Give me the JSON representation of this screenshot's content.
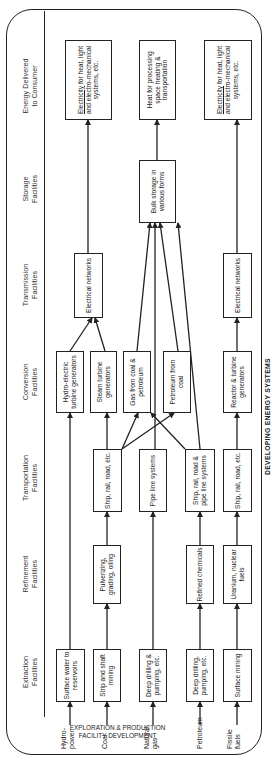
{
  "title": "DEVELOPING ENERGY SYSTEMS",
  "footer": [
    "EXPLORATION & PRODUCTION",
    "FACILITY DEVELOPMENT"
  ],
  "columns": [
    {
      "id": "extraction",
      "label": [
        "Extraction",
        "Facilities"
      ]
    },
    {
      "id": "refinement",
      "label": [
        "Refinement",
        "Facilities"
      ]
    },
    {
      "id": "transportation",
      "label": [
        "Transportation",
        "Facilities"
      ]
    },
    {
      "id": "conversion",
      "label": [
        "Conversion",
        "Facilities"
      ]
    },
    {
      "id": "transmission",
      "label": [
        "Transmission",
        "Facilities"
      ]
    },
    {
      "id": "storage",
      "label": [
        "Storage",
        "Facilities"
      ]
    },
    {
      "id": "delivered",
      "label": [
        "Energy Delivered",
        "to Consumer"
      ]
    }
  ],
  "sources": [
    {
      "id": "hydro",
      "label": [
        "Hydro-",
        "power"
      ]
    },
    {
      "id": "coal",
      "label": [
        "Coal"
      ]
    },
    {
      "id": "gas",
      "label": [
        "Natural",
        "gas"
      ]
    },
    {
      "id": "petroleum",
      "label": [
        "Petroleum"
      ]
    },
    {
      "id": "fissile",
      "label": [
        "Fissile",
        "fuels"
      ]
    }
  ],
  "boxes": {
    "hydro_extract": "Surface water to reservoirs",
    "coal_extract": "Strip and shaft mining",
    "gas_extract": "Deep drilling & pumping, etc.",
    "petro_extract": "Deep drilling, pumping, etc.",
    "fissile_extract": "Surface mining",
    "coal_refine": "Pulverizing, grading, oiling",
    "petro_refine": "Refined chemicals",
    "fissile_refine": "Uranium, nuclear fuels",
    "coal_transport": "Ship, rail, road, etc.",
    "gas_transport": "Pipe line systems",
    "petro_transport": "Ship, rail, road & pipe line systems",
    "fissile_transport": "Ship, rail, road, etc.",
    "hydro_convert": "Hydro-electric turbine generators",
    "steam_convert": "Steam turbine generators",
    "gas_convert": "Gas from coal & petroleum",
    "petcoal_convert": "Petroleum from coal",
    "nuclear_convert": "Reactor & turbine generators",
    "elec_net_1": "Electrical networks",
    "elec_net_2": "Electrical networks",
    "bulk_storage": "Bulk storage in various forms",
    "deliver_elec_1_u": "Electricity",
    "deliver_elec_1_rest": " for heat, light and electro-mechanical systems, etc.",
    "deliver_heat": "Heat for processing space heating & transportation",
    "deliver_elec_2_u": "Electricity",
    "deliver_elec_2_rest": " for heat, light and electro-mechanical systems, etc."
  }
}
